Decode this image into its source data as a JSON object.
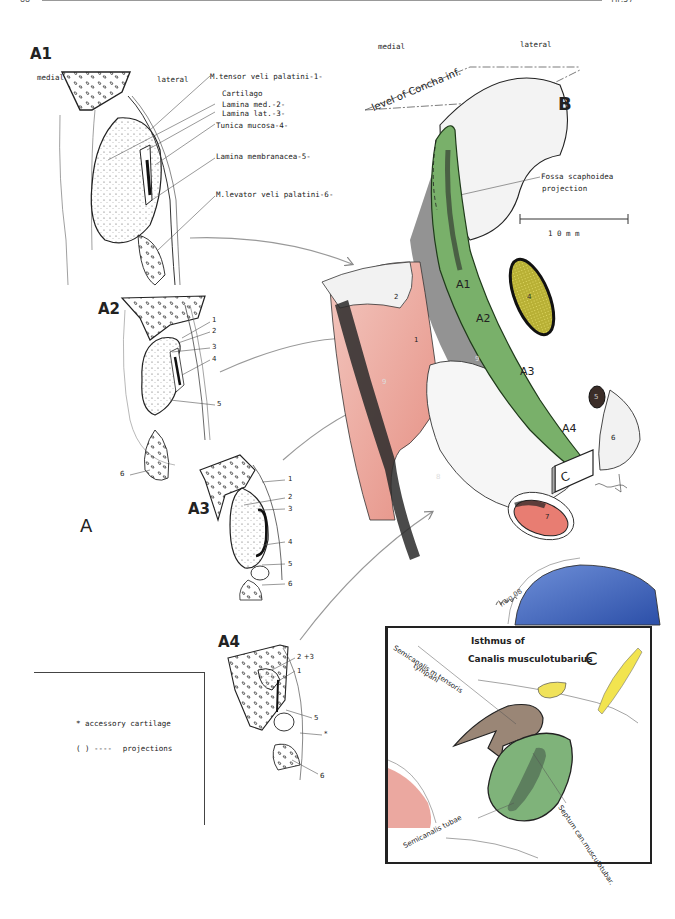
{
  "page": {
    "header": {
      "page_number": "88",
      "running_head": "TIP.57"
    }
  },
  "panel_a": {
    "letter": "A",
    "sub_panels": [
      {
        "id": "A1",
        "orientation_left": "medial",
        "orientation_right": "lateral"
      },
      {
        "id": "A2"
      },
      {
        "id": "A3"
      },
      {
        "id": "A4"
      }
    ],
    "a1_labels": [
      "M.tensor veli palatini-1-",
      "Cartilago",
      "Lamina med.-2-",
      "Lamina lat.-3-",
      "Tunica mucosa-4-",
      "Lamina membranacea-5-",
      "M.levator veli palatini-6-"
    ],
    "a2_numbers": [
      "1",
      "2",
      "3",
      "4",
      "5",
      "6"
    ],
    "a3_numbers": [
      "1",
      "2",
      "3",
      "4",
      "5",
      "6"
    ],
    "a4_numbers": [
      "2 +3",
      "1",
      "5",
      "*",
      "6"
    ]
  },
  "legend": {
    "items": [
      {
        "symbol": "*",
        "text": "accessory cartilage"
      },
      {
        "symbol": "( )  ----",
        "text": "projections"
      }
    ]
  },
  "panel_b": {
    "letter": "B",
    "orientation_left": "medial",
    "orientation_right": "lateral",
    "level_label": "level of Concha inf.",
    "fossa_label_line1": "Fossa scaphoidea",
    "fossa_label_line2": "projection",
    "scale_bar": "1 0   m m",
    "section_labels": [
      "A1",
      "A2",
      "A3",
      "A4"
    ],
    "structure_numbers": [
      "1",
      "2",
      "4",
      "5",
      "6",
      "7",
      "8",
      "9",
      "9"
    ],
    "inset_marker": "C",
    "signature": "hwg 08",
    "colors": {
      "green": "#6fa85f",
      "red": "#e0857a",
      "yellow": "#c9c23a",
      "blue": "#3f64b8",
      "brown": "#8b7866"
    }
  },
  "panel_c": {
    "letter": "C",
    "title_line1": "Isthmus of",
    "title_line2": "Canalis musculotubarius",
    "label_tensor_line1": "Semicanalis m.tensoris",
    "label_tensor_line2": "tympani",
    "label_tubae": "Semicanalis tubae",
    "label_septum": "Septum can.musculotubar."
  }
}
